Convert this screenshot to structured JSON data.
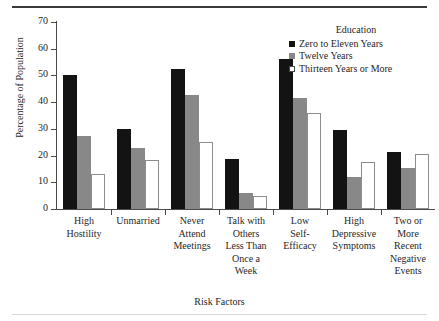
{
  "chart_data": {
    "type": "bar",
    "title": "",
    "xlabel": "Risk Factors",
    "ylabel": "Percentage of Population",
    "ylim": [
      0,
      70
    ],
    "yticks": [
      0,
      10,
      20,
      30,
      40,
      50,
      60,
      70
    ],
    "grid": false,
    "legend_title": "Education",
    "legend_position": "top-right",
    "categories": [
      "High\nHostility",
      "Unmarried",
      "Never\nAttend\nMeetings",
      "Talk with\nOthers\nLess Than\nOnce a\nWeek",
      "Low\nSelf-\nEfficacy",
      "High\nDepressive\nSymptoms",
      "Two or\nMore\nRecent\nNegative\nEvents"
    ],
    "series": [
      {
        "name": "Zero to Eleven Years",
        "color": "#131313",
        "values": [
          50.0,
          30.0,
          52.5,
          18.8,
          56.0,
          29.5,
          21.5
        ]
      },
      {
        "name": "Twelve Years",
        "color": "#888888",
        "values": [
          27.5,
          23.0,
          42.5,
          6.0,
          41.5,
          11.8,
          15.5
        ]
      },
      {
        "name": "Thirteen Years or More",
        "color": "#ffffff",
        "values": [
          13.0,
          18.5,
          25.0,
          4.8,
          35.8,
          17.5,
          20.5
        ]
      }
    ]
  }
}
